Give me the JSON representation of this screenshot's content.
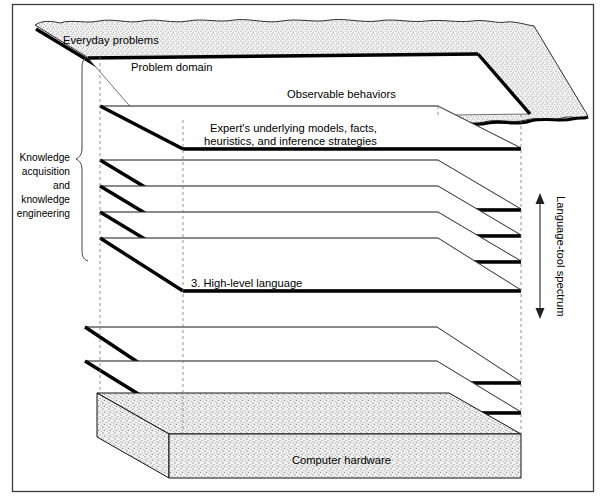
{
  "figure": {
    "title_alt": "Layered architecture diagram of knowledge system and language-tool spectrum",
    "frame": {
      "border_color": "#3c3c3c"
    }
  },
  "annotations": {
    "left_bracket_label": "Knowledge\nacquisition\nand\nknowledge\nengineering",
    "left_bracket_lines": [
      "Knowledge",
      "acquisition",
      "and",
      "knowledge",
      "engineering"
    ],
    "right_spectrum_label": "Language-tool spectrum"
  },
  "layers": [
    {
      "id": "everyday-problems",
      "label": "Everyday problems",
      "kind": "cloud",
      "texture": "stipple"
    },
    {
      "id": "problem-domain",
      "label": "Problem domain",
      "kind": "slab"
    },
    {
      "id": "observable-behaviors",
      "label": "Observable behaviors",
      "kind": "slab"
    },
    {
      "id": "experts-underlying-models",
      "label": "Expert's underlying models, facts,",
      "label_line2": "heuristics, and inference strategies",
      "kind": "slab"
    },
    {
      "id": "knowledge-system",
      "label": "6. Knowledge system",
      "number": "6",
      "kind": "slab"
    },
    {
      "id": "tool",
      "label": "5. Tool",
      "number": "5",
      "kind": "slab"
    },
    {
      "id": "environment",
      "label": "4. Environment",
      "number": "4",
      "kind": "slab"
    },
    {
      "id": "high-level-language",
      "label": "3. High-level language",
      "number": "3",
      "kind": "slab"
    },
    {
      "id": "operating-system",
      "label": "2. Operating system",
      "number": "2",
      "kind": "slab"
    },
    {
      "id": "machine-language",
      "label": "1. Machine language",
      "number": "1",
      "kind": "slab"
    },
    {
      "id": "computer-hardware",
      "label": "Computer hardware",
      "kind": "block",
      "texture": "stipple"
    }
  ],
  "colors": {
    "ink": "#000000",
    "frame": "#3c3c3c",
    "dashed_guide": "#777777",
    "stipple": "#b9b9b9",
    "paper": "#ffffff"
  }
}
